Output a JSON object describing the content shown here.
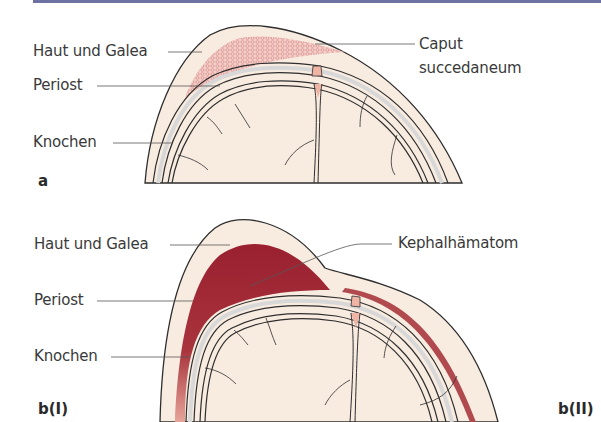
{
  "figure": {
    "colors": {
      "scalp": "#f8ebe0",
      "bone": "#e9e9e9",
      "outline": "#2e2e2e",
      "caput_mesh": "#d4727a",
      "hematoma": "#9b2533",
      "hematoma_light": "#c9646a",
      "suture": "#f0b4a4",
      "top_rule": "#6d72a0"
    },
    "panels": [
      {
        "id": "a",
        "panel_label": "a",
        "labels": {
          "skin": "Haut und Galea",
          "periost": "Periost",
          "bone": "Knochen",
          "lesion_line1": "Caput",
          "lesion_line2": "succedaneum"
        }
      },
      {
        "id": "b",
        "panel_label_left": "b(I)",
        "panel_label_right": "b(II)",
        "labels": {
          "skin": "Haut und Galea",
          "lesion": "Kephalhämatom",
          "periost": "Periost",
          "bone": "Knochen"
        }
      }
    ]
  }
}
